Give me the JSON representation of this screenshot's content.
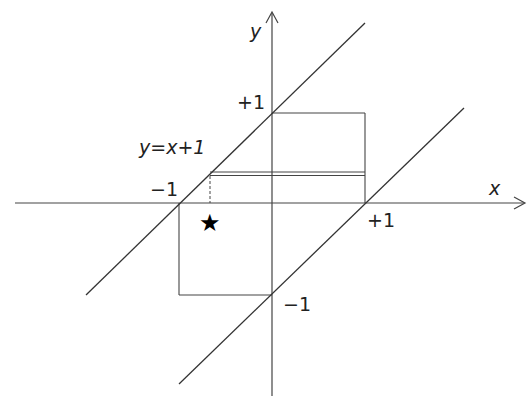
{
  "diagram": {
    "axes": {
      "x_label": "x",
      "y_label": "y"
    },
    "tick_labels": {
      "x_pos": "+1",
      "x_neg": "−1",
      "y_pos": "+1",
      "y_neg": "−1"
    },
    "lines": [
      {
        "label": "y=x+1",
        "equation": "y = x + 1"
      },
      {
        "label": "",
        "equation": "y = x − 1"
      }
    ],
    "rectangle": {
      "x_range": [
        -1,
        1
      ],
      "y_range": [
        -1,
        1
      ]
    },
    "double_line": {
      "y": 0.33,
      "x_range": [
        -0.67,
        1
      ]
    },
    "marker": {
      "symbol": "★",
      "name": "star"
    },
    "colors": {
      "stroke": "#333333",
      "text": "#222222",
      "background": "#ffffff"
    }
  }
}
